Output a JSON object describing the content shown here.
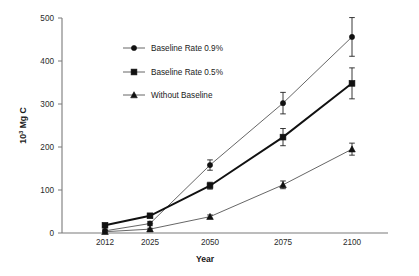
{
  "chart_data": {
    "type": "line",
    "title": "",
    "subtitle": "",
    "xlabel": "Year",
    "ylabel": "10³ Mg C",
    "ylabel_base": "10",
    "ylabel_sup": "3",
    "ylabel_rest": " Mg C",
    "categories": [
      "2012",
      "2025",
      "2050",
      "2075",
      "2100"
    ],
    "x": [
      2012,
      2025,
      2050,
      2075,
      2100
    ],
    "ylim": [
      0,
      500
    ],
    "yticks": [
      0,
      100,
      200,
      300,
      400,
      500
    ],
    "ytick_labels": [
      "0",
      "100",
      "200",
      "300",
      "400",
      "500"
    ],
    "xtick_labels": [
      "2012",
      "2025",
      "2050",
      "2075",
      "2100"
    ],
    "grid": false,
    "legend_position": "upper-left-inside",
    "series": [
      {
        "name": "Baseline Rate 0.9%",
        "marker": "circle",
        "line_weight": "thin",
        "values": [
          5,
          22,
          158,
          302,
          456
        ],
        "errors": [
          2,
          5,
          12,
          25,
          45
        ]
      },
      {
        "name": "Baseline Rate 0.5%",
        "marker": "square",
        "line_weight": "thick",
        "values": [
          18,
          40,
          110,
          223,
          348
        ],
        "errors": [
          3,
          4,
          8,
          20,
          36
        ]
      },
      {
        "name": "Without Baseline",
        "marker": "triangle",
        "line_weight": "thin",
        "values": [
          3,
          9,
          38,
          112,
          195
        ],
        "errors": [
          1,
          2,
          4,
          9,
          14
        ]
      }
    ],
    "legend": [
      "Baseline Rate 0.9%",
      "Baseline Rate 0.5%",
      "Without Baseline"
    ],
    "colors": {
      "line_thin": "#555555",
      "line_thick": "#111111",
      "marker": "#111111",
      "axis": "#7a7a7a",
      "text": "#1a1a1a",
      "background": "#ffffff"
    }
  }
}
